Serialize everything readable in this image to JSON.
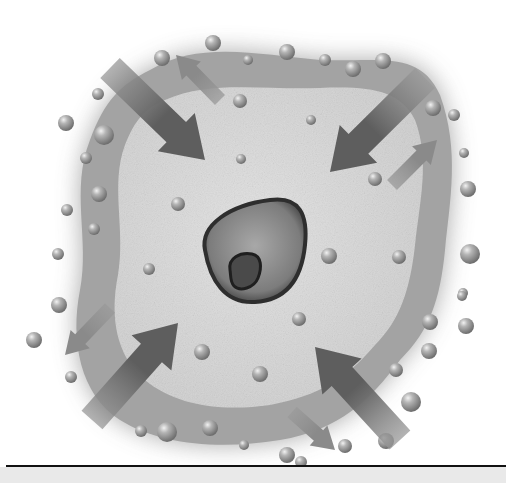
{
  "figure": {
    "colors": {
      "background": "#ffffff",
      "membrane_outer": "#9a9a9a",
      "cytoplasm": "#d6d6d6",
      "nucleus_fill": "#8c8c8c",
      "nucleus_rim": "#2e2e2e",
      "nucleolus": "#3a3a3a",
      "arrow_dark": "#5e5e5e",
      "arrow_light": "#8a8a8a",
      "bubble": "#a6a6a6",
      "baseline": "#111111",
      "footer": "#e9e9e9"
    },
    "cell_outline": "M 150 70 C 200 40, 260 55, 320 60 C 380 62, 420 50, 440 95 C 460 150, 450 200, 445 250 C 440 300, 430 330, 400 360 C 370 400, 340 430, 280 440 C 220 450, 160 445, 120 420 C 80 395, 70 340, 80 290 C 90 240, 70 190, 90 140 C 105 100, 120 85, 150 70 Z",
    "cytoplasm_outline": "M 165 100 C 210 80, 260 90, 320 88 C 370 86, 400 90, 415 120 C 430 160, 420 200, 415 245 C 410 290, 400 320, 375 345 C 345 380, 320 395, 270 405 C 220 412, 175 405, 145 380 C 115 355, 110 315, 118 275 C 126 230, 110 185, 125 145 C 135 120, 145 108, 165 100 Z",
    "nucleus": {
      "path": "M 205 250 C 200 225, 230 205, 270 200 C 300 196, 308 215, 305 245 C 302 275, 290 300, 255 302 C 225 304, 210 280, 205 250 Z"
    },
    "nucleolus": {
      "path": "M 230 270 C 228 258, 240 252, 252 254 C 262 256, 262 268, 258 278 C 254 288, 240 292, 234 286 C 230 282, 231 276, 230 270 Z"
    },
    "arrows": [
      {
        "id": "inflow-top-left",
        "x1": 110,
        "y1": 68,
        "x2": 205,
        "y2": 160,
        "width": 28,
        "head": 40,
        "tone": "dark"
      },
      {
        "id": "outflow-top-left",
        "x1": 220,
        "y1": 100,
        "x2": 176,
        "y2": 55,
        "width": 14,
        "head": 22,
        "tone": "light"
      },
      {
        "id": "inflow-top-right",
        "x1": 425,
        "y1": 78,
        "x2": 330,
        "y2": 172,
        "width": 28,
        "head": 40,
        "tone": "dark"
      },
      {
        "id": "outflow-right",
        "x1": 392,
        "y1": 185,
        "x2": 437,
        "y2": 140,
        "width": 14,
        "head": 22,
        "tone": "light"
      },
      {
        "id": "outflow-left",
        "x1": 110,
        "y1": 308,
        "x2": 65,
        "y2": 355,
        "width": 14,
        "head": 22,
        "tone": "light"
      },
      {
        "id": "inflow-bottom-left",
        "x1": 92,
        "y1": 420,
        "x2": 178,
        "y2": 323,
        "width": 28,
        "head": 40,
        "tone": "dark"
      },
      {
        "id": "inflow-bottom-right",
        "x1": 400,
        "y1": 440,
        "x2": 315,
        "y2": 347,
        "width": 28,
        "head": 40,
        "tone": "dark"
      },
      {
        "id": "outflow-bottom",
        "x1": 292,
        "y1": 412,
        "x2": 335,
        "y2": 450,
        "width": 14,
        "head": 22,
        "tone": "light"
      }
    ],
    "outer_bubbles": [
      {
        "cx": 213,
        "cy": 43,
        "r": 8
      },
      {
        "cx": 248,
        "cy": 60,
        "r": 5
      },
      {
        "cx": 287,
        "cy": 52,
        "r": 8
      },
      {
        "cx": 325,
        "cy": 60,
        "r": 6
      },
      {
        "cx": 353,
        "cy": 69,
        "r": 8
      },
      {
        "cx": 383,
        "cy": 61,
        "r": 8
      },
      {
        "cx": 162,
        "cy": 58,
        "r": 8
      },
      {
        "cx": 98,
        "cy": 94,
        "r": 6
      },
      {
        "cx": 66,
        "cy": 123,
        "r": 8
      },
      {
        "cx": 104,
        "cy": 135,
        "r": 10
      },
      {
        "cx": 86,
        "cy": 158,
        "r": 6
      },
      {
        "cx": 99,
        "cy": 194,
        "r": 8
      },
      {
        "cx": 67,
        "cy": 210,
        "r": 6
      },
      {
        "cx": 94,
        "cy": 229,
        "r": 6
      },
      {
        "cx": 58,
        "cy": 254,
        "r": 6
      },
      {
        "cx": 59,
        "cy": 305,
        "r": 8
      },
      {
        "cx": 34,
        "cy": 340,
        "r": 8
      },
      {
        "cx": 71,
        "cy": 377,
        "r": 6
      },
      {
        "cx": 433,
        "cy": 108,
        "r": 8
      },
      {
        "cx": 454,
        "cy": 115,
        "r": 6
      },
      {
        "cx": 464,
        "cy": 153,
        "r": 5
      },
      {
        "cx": 468,
        "cy": 189,
        "r": 8
      },
      {
        "cx": 470,
        "cy": 254,
        "r": 10
      },
      {
        "cx": 463,
        "cy": 293,
        "r": 5
      },
      {
        "cx": 466,
        "cy": 326,
        "r": 8
      },
      {
        "cx": 430,
        "cy": 322,
        "r": 8
      },
      {
        "cx": 429,
        "cy": 351,
        "r": 8
      },
      {
        "cx": 462,
        "cy": 296,
        "r": 5
      },
      {
        "cx": 396,
        "cy": 370,
        "r": 7
      },
      {
        "cx": 411,
        "cy": 402,
        "r": 10
      },
      {
        "cx": 386,
        "cy": 441,
        "r": 8
      },
      {
        "cx": 141,
        "cy": 431,
        "r": 6
      },
      {
        "cx": 167,
        "cy": 432,
        "r": 10
      },
      {
        "cx": 210,
        "cy": 428,
        "r": 8
      },
      {
        "cx": 244,
        "cy": 445,
        "r": 5
      },
      {
        "cx": 287,
        "cy": 455,
        "r": 8
      },
      {
        "cx": 345,
        "cy": 446,
        "r": 7
      },
      {
        "cx": 301,
        "cy": 462,
        "r": 6
      }
    ],
    "inner_bubbles": [
      {
        "cx": 240,
        "cy": 101,
        "r": 7
      },
      {
        "cx": 241,
        "cy": 159,
        "r": 5
      },
      {
        "cx": 311,
        "cy": 120,
        "r": 5
      },
      {
        "cx": 178,
        "cy": 204,
        "r": 7
      },
      {
        "cx": 375,
        "cy": 179,
        "r": 7
      },
      {
        "cx": 149,
        "cy": 269,
        "r": 6
      },
      {
        "cx": 329,
        "cy": 256,
        "r": 8
      },
      {
        "cx": 399,
        "cy": 257,
        "r": 7
      },
      {
        "cx": 202,
        "cy": 352,
        "r": 8
      },
      {
        "cx": 299,
        "cy": 319,
        "r": 7
      },
      {
        "cx": 260,
        "cy": 374,
        "r": 8
      }
    ]
  }
}
